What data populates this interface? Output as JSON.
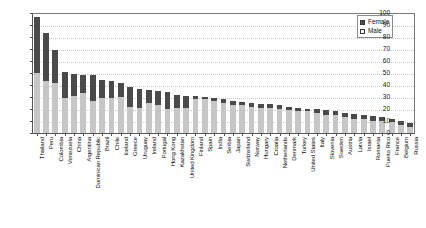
{
  "chart_data": {
    "type": "bar",
    "stacked": true,
    "title": "",
    "subtitle": "",
    "xlabel": "",
    "ylabel": "",
    "ylim": [
      0,
      100
    ],
    "ytick_labels": [
      "0",
      "10",
      "20",
      "30",
      "40",
      "50",
      "60",
      "70",
      "80",
      "90",
      "100"
    ],
    "ytick_values": [
      0,
      10,
      20,
      30,
      40,
      50,
      60,
      70,
      80,
      90,
      100
    ],
    "grid": "horizontal-dotted",
    "legend_position": "top-right",
    "legend": [
      "Female",
      "Male"
    ],
    "colors": {
      "female": "#4a4a4a",
      "male": "#c6c6c6",
      "grid": "#c9c9c9",
      "axis": "#555555",
      "background": "#ffffff"
    },
    "categories": [
      "Thailand",
      "Peru",
      "Colombia",
      "Venezuela",
      "China",
      "Argentina",
      "Dominican Republic",
      "Brazil",
      "Chile",
      "Iceland",
      "Greece",
      "Uruguay",
      "Ireland",
      "Portugal",
      "Hong Kong",
      "Kazakhstan",
      "United Kingdom",
      "Finland",
      "Spain",
      "India",
      "Serbia",
      "Japan",
      "Switzerland",
      "Norway",
      "Hungary",
      "Croatia",
      "Netherlands",
      "Denmark",
      "Turkey",
      "United States",
      "Italy",
      "Slovenia",
      "Sweden",
      "Austria",
      "Latvia",
      "Israel",
      "Romania",
      "Puerto Rico",
      "France",
      "Belgium",
      "Russia"
    ],
    "series": [
      {
        "name": "Male",
        "values": [
          50,
          43,
          42,
          29,
          31,
          33,
          27,
          29,
          29,
          30,
          22,
          21,
          25,
          23,
          20,
          21,
          21,
          28,
          28,
          27,
          25,
          23,
          23,
          22,
          21,
          21,
          20,
          19,
          18,
          18,
          17,
          15,
          15,
          13,
          12,
          12,
          10,
          10,
          9,
          7,
          5
        ]
      },
      {
        "name": "Female",
        "values": [
          47,
          40,
          27,
          22,
          18,
          15,
          21,
          15,
          14,
          12,
          16,
          16,
          11,
          12,
          14,
          11,
          10,
          3,
          2,
          2,
          3,
          4,
          3,
          3,
          3,
          3,
          3,
          3,
          3,
          2,
          3,
          4,
          3,
          4,
          4,
          3,
          4,
          3,
          3,
          3,
          3
        ]
      }
    ],
    "totals": [
      97,
      83,
      69,
      51,
      49,
      48,
      48,
      44,
      43,
      42,
      38,
      37,
      36,
      35,
      34,
      32,
      31,
      31,
      30,
      29,
      28,
      27,
      26,
      25,
      24,
      24,
      23,
      22,
      21,
      20,
      20,
      19,
      18,
      17,
      16,
      15,
      14,
      13,
      12,
      10,
      8
    ]
  },
  "legend": {
    "female_label": "Female",
    "male_label": "Male"
  }
}
